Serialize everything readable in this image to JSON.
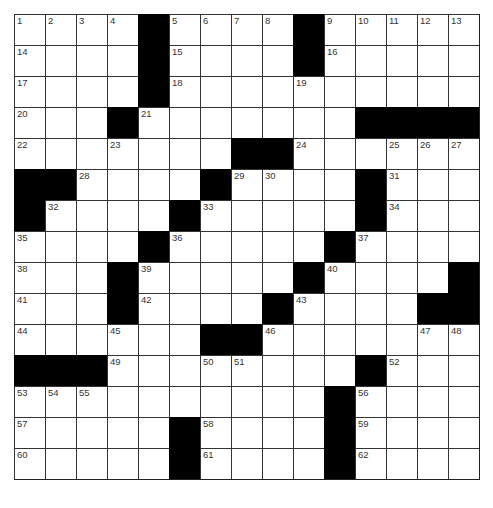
{
  "puzzle": {
    "rows": 15,
    "cols": 15,
    "colors": {
      "block": "#000000",
      "cell": "#ffffff",
      "line": "#333333",
      "number": "#333333"
    },
    "grid": [
      [
        "1",
        "2",
        "3",
        "4",
        "#",
        "5",
        "6",
        "7",
        "8",
        "#",
        "9",
        "10",
        "11",
        "12",
        "13"
      ],
      [
        "14",
        ".",
        ".",
        ".",
        "#",
        "15",
        ".",
        ".",
        ".",
        "#",
        "16",
        ".",
        ".",
        ".",
        "."
      ],
      [
        "17",
        ".",
        ".",
        ".",
        "#",
        "18",
        ".",
        ".",
        ".",
        "19",
        ".",
        ".",
        ".",
        ".",
        "."
      ],
      [
        "20",
        ".",
        ".",
        "#",
        "21",
        ".",
        ".",
        ".",
        ".",
        ".",
        ".",
        "#",
        "#",
        "#",
        "#"
      ],
      [
        "22",
        ".",
        ".",
        "23",
        ".",
        ".",
        ".",
        "#",
        "#",
        "24",
        ".",
        ".",
        "25",
        "26",
        "27"
      ],
      [
        "#",
        "#",
        "28",
        ".",
        ".",
        ".",
        "#",
        "29",
        "30",
        ".",
        ".",
        "#",
        "31",
        ".",
        "."
      ],
      [
        "#",
        "32",
        ".",
        ".",
        ".",
        "#",
        "33",
        ".",
        ".",
        ".",
        ".",
        "#",
        "34",
        ".",
        "."
      ],
      [
        "35",
        ".",
        ".",
        ".",
        "#",
        "36",
        ".",
        ".",
        ".",
        ".",
        "#",
        "37",
        ".",
        ".",
        "."
      ],
      [
        "38",
        ".",
        ".",
        "#",
        "39",
        ".",
        ".",
        ".",
        ".",
        "#",
        "40",
        ".",
        ".",
        ".",
        "#"
      ],
      [
        "41",
        ".",
        ".",
        "#",
        "42",
        ".",
        ".",
        ".",
        "#",
        "43",
        ".",
        ".",
        ".",
        "#",
        "#"
      ],
      [
        "44",
        ".",
        ".",
        "45",
        ".",
        ".",
        "#",
        "#",
        "46",
        ".",
        ".",
        ".",
        ".",
        "47",
        "48"
      ],
      [
        "#",
        "#",
        "#",
        "49",
        ".",
        ".",
        "50",
        "51",
        ".",
        ".",
        ".",
        "#",
        "52",
        ".",
        "."
      ],
      [
        "53",
        "54",
        "55",
        ".",
        ".",
        ".",
        ".",
        ".",
        ".",
        ".",
        "#",
        "56",
        ".",
        ".",
        "."
      ],
      [
        "57",
        ".",
        ".",
        ".",
        ".",
        "#",
        "58",
        ".",
        ".",
        ".",
        "#",
        "59",
        ".",
        ".",
        "."
      ],
      [
        "60",
        ".",
        ".",
        ".",
        ".",
        "#",
        "61",
        ".",
        ".",
        ".",
        "#",
        "62",
        ".",
        ".",
        "."
      ]
    ],
    "entries": []
  }
}
